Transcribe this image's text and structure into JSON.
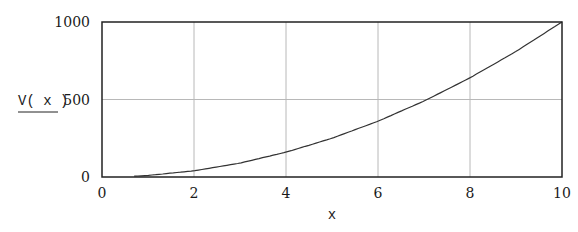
{
  "chart_data": {
    "type": "line",
    "title": "",
    "xlabel": "x",
    "ylabel": "V( x )",
    "xlim": [
      0,
      10
    ],
    "ylim": [
      0,
      1000
    ],
    "grid": true,
    "legend": null,
    "x_ticks": [
      "0",
      "2",
      "4",
      "6",
      "8",
      "10"
    ],
    "y_ticks": [
      "0",
      "500",
      "1000"
    ],
    "y_gridlines": [
      500
    ],
    "x_gridlines": [
      2,
      4,
      6,
      8
    ],
    "series": [
      {
        "name": "V(x)",
        "x": [
          0.7,
          1,
          2,
          3,
          4,
          5,
          6,
          7,
          8,
          9,
          10
        ],
        "values": [
          5,
          10,
          40,
          90,
          160,
          250,
          360,
          490,
          640,
          810,
          1000
        ]
      }
    ],
    "colors": {
      "line": "#333333",
      "grid": "#b8b8b8",
      "axis": "#222222"
    }
  }
}
